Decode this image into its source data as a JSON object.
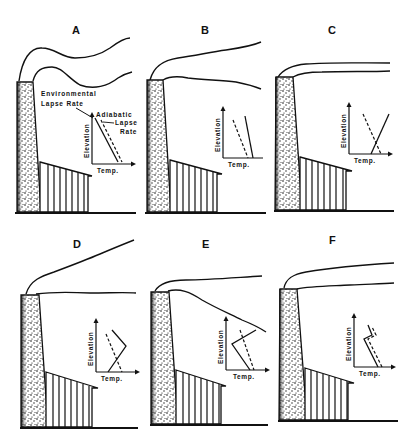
{
  "figure": {
    "colors": {
      "ink": "#111111",
      "background": "#ffffff"
    }
  },
  "panels": [
    {
      "letter": "A",
      "ylabel": "Elevation",
      "xlabel": "Temp.",
      "annotations": {
        "env": "Environmental",
        "env2": "Lapse Rate",
        "adi": "Adiabatic",
        "adi2": "Lapse",
        "adi3": "Rate"
      }
    },
    {
      "letter": "B",
      "ylabel": "Elevation",
      "xlabel": "Temp."
    },
    {
      "letter": "C",
      "ylabel": "Elevation",
      "xlabel": "Temp."
    },
    {
      "letter": "D",
      "ylabel": "Elevation",
      "xlabel": "Temp."
    },
    {
      "letter": "E",
      "ylabel": "Elevation",
      "xlabel": "Temp."
    },
    {
      "letter": "F",
      "ylabel": "Elevation",
      "xlabel": "Temp."
    }
  ],
  "legend": {
    "solid_line": "Environmental Lapse Rate",
    "dashed_line": "Adiabatic Lapse Rate"
  }
}
